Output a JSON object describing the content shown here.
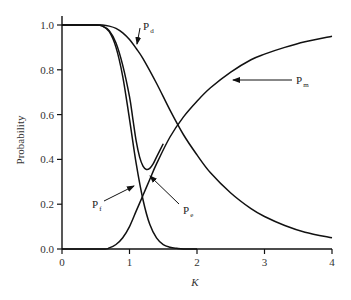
{
  "chart_data": {
    "type": "line",
    "title": "",
    "xlabel": "K",
    "ylabel": "Probability",
    "xlim": [
      0,
      4
    ],
    "ylim": [
      0,
      1.0
    ],
    "grid": false,
    "legend": "inline arrow annotations",
    "x_ticks": [
      0,
      1,
      2,
      3,
      4
    ],
    "x_tick_labels": [
      "0",
      "1",
      "2",
      "3",
      "4"
    ],
    "y_ticks": [
      0.0,
      0.2,
      0.4,
      0.6,
      0.8,
      1.0
    ],
    "y_tick_labels": [
      "0.0",
      "0.2",
      "0.4",
      "0.6",
      "0.8",
      "1.0"
    ],
    "series": [
      {
        "name": "Pd",
        "label_main": "P",
        "label_sub": "d",
        "x": [
          0,
          0.5,
          0.6,
          0.7,
          0.8,
          0.9,
          1.0,
          1.1,
          1.2,
          1.4,
          1.6,
          1.8,
          2.0,
          2.2,
          2.5,
          2.8,
          3.0,
          3.3,
          3.6,
          4.0
        ],
        "values": [
          1.0,
          1.0,
          1.0,
          0.995,
          0.985,
          0.965,
          0.935,
          0.895,
          0.85,
          0.74,
          0.62,
          0.51,
          0.42,
          0.34,
          0.25,
          0.18,
          0.145,
          0.105,
          0.075,
          0.05
        ]
      },
      {
        "name": "Pf",
        "label_main": "P",
        "label_sub": "f",
        "x": [
          0,
          0.5,
          0.6,
          0.7,
          0.8,
          0.9,
          1.0,
          1.1,
          1.2,
          1.3,
          1.4,
          1.5,
          1.6,
          1.7,
          1.8,
          2.0
        ],
        "values": [
          1.0,
          1.0,
          0.995,
          0.97,
          0.9,
          0.77,
          0.58,
          0.38,
          0.22,
          0.11,
          0.05,
          0.02,
          0.008,
          0.003,
          0.0,
          0.0
        ]
      },
      {
        "name": "Pm",
        "label_main": "P",
        "label_sub": "m",
        "x": [
          0,
          0.6,
          0.7,
          0.8,
          0.9,
          1.0,
          1.1,
          1.2,
          1.3,
          1.4,
          1.6,
          1.8,
          2.0,
          2.2,
          2.5,
          2.8,
          3.0,
          3.3,
          3.6,
          4.0
        ],
        "values": [
          0.0,
          0.0,
          0.005,
          0.02,
          0.05,
          0.1,
          0.17,
          0.24,
          0.31,
          0.38,
          0.5,
          0.59,
          0.66,
          0.72,
          0.79,
          0.845,
          0.87,
          0.9,
          0.925,
          0.95
        ]
      },
      {
        "name": "Pe",
        "label_main": "P",
        "label_sub": "e",
        "x": [
          0,
          0.5,
          0.6,
          0.7,
          0.8,
          0.9,
          1.0,
          1.05,
          1.1,
          1.15,
          1.2,
          1.25,
          1.3,
          1.35,
          1.4,
          1.5
        ],
        "values": [
          1.0,
          1.0,
          0.995,
          0.975,
          0.92,
          0.82,
          0.68,
          0.58,
          0.48,
          0.41,
          0.37,
          0.355,
          0.36,
          0.38,
          0.41,
          0.47
        ]
      }
    ],
    "annotations": [
      {
        "series": "Pd",
        "text": "Pd",
        "label_pos": [
          143,
          30
        ],
        "arrow_tip": [
          137,
          44
        ]
      },
      {
        "series": "Pm",
        "text": "Pm",
        "label_pos": [
          296,
          84
        ],
        "arrow_tip": [
          233,
          80
        ]
      },
      {
        "series": "Pf",
        "text": "Pf",
        "label_pos": [
          92,
          208
        ],
        "arrow_tip": [
          134,
          186
        ]
      },
      {
        "series": "Pe",
        "text": "Pe",
        "label_pos": [
          183,
          214
        ],
        "arrow_tip": [
          150,
          176
        ]
      }
    ]
  },
  "axes": {
    "xlabel": "K",
    "ylabel": "Probability"
  }
}
